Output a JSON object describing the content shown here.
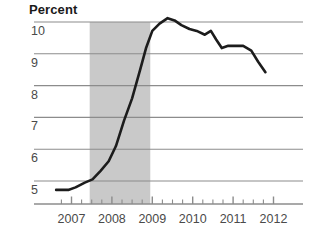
{
  "chart_data": {
    "type": "line",
    "title": "Percent",
    "xlabel": "",
    "ylabel": "Percent",
    "ylim": [
      4.4,
      10.35
    ],
    "xlim": [
      2006.5,
      2012.1
    ],
    "grid": true,
    "legend": "none",
    "y_ticks": [
      "10",
      "9",
      "8",
      "7",
      "6",
      "5"
    ],
    "y_tick_values": [
      10,
      9,
      8,
      7,
      6,
      5
    ],
    "x_ticks": [
      "2007",
      "2008",
      "2009",
      "2010",
      "2011",
      "2012"
    ],
    "x_tick_values": [
      2007,
      2008,
      2009,
      2010,
      2011,
      2012
    ],
    "minor_tick_interval": 0.25,
    "shaded_region": {
      "label": "recession",
      "x_start": 2007.45,
      "x_end": 2008.95,
      "color": "#c9c9c9"
    },
    "series": [
      {
        "name": "Unemployment rate",
        "color": "#1c1c1c",
        "x": [
          2006.62,
          2006.92,
          2007.1,
          2007.33,
          2007.52,
          2007.72,
          2007.92,
          2008.1,
          2008.3,
          2008.5,
          2008.7,
          2008.85,
          2009.0,
          2009.18,
          2009.38,
          2009.55,
          2009.72,
          2009.92,
          2010.1,
          2010.3,
          2010.45,
          2010.58,
          2010.72,
          2010.88,
          2011.05,
          2011.25,
          2011.45,
          2011.62,
          2011.8
        ],
        "values": [
          4.72,
          4.72,
          4.8,
          4.95,
          5.05,
          5.32,
          5.62,
          6.1,
          6.9,
          7.6,
          8.5,
          9.2,
          9.72,
          9.95,
          10.12,
          10.05,
          9.9,
          9.78,
          9.72,
          9.6,
          9.72,
          9.45,
          9.18,
          9.25,
          9.25,
          9.25,
          9.1,
          8.75,
          8.42
        ]
      }
    ]
  },
  "axis": {
    "y_label_color": "#4a4a4a",
    "x_label_color": "#4a4a4a",
    "gridline_color": "#8c8c8c",
    "axis_line_color": "#8c8c8c"
  }
}
